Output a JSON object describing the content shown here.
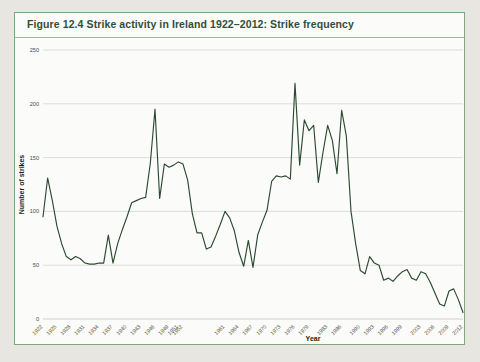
{
  "figure": {
    "title": "Figure 12.4  Strike activity in Ireland 1922–2012: Strike frequency",
    "frame_color": "#7ea87a",
    "background_color": "#fbfbf9"
  },
  "chart_data": {
    "type": "line",
    "title": "Figure 12.4  Strike activity in Ireland 1922–2012: Strike frequency",
    "xlabel": "Year",
    "ylabel": "Number of strikes",
    "line_color": "#2c4a31",
    "grid": true,
    "legend": "none",
    "ylim": [
      0,
      250
    ],
    "ytick_labels": [
      "0",
      "50",
      "100",
      "150",
      "200",
      "250"
    ],
    "yticks": [
      0,
      50,
      100,
      150,
      200,
      250
    ],
    "xlim": [
      1922,
      2012
    ],
    "xtick_labels": [
      "1922",
      "1925",
      "1928",
      "1931",
      "1934",
      "1937",
      "1940",
      "1943",
      "1946",
      "1949",
      "1951",
      "1952",
      "1961",
      "1964",
      "1967",
      "1970",
      "1973",
      "1976",
      "1979",
      "1983",
      "1986",
      "1990",
      "1993",
      "1996",
      "1999",
      "2003",
      "2006",
      "2009",
      "2012"
    ],
    "xticks": [
      1922,
      1925,
      1928,
      1931,
      1934,
      1937,
      1940,
      1943,
      1946,
      1949,
      1951,
      1952,
      1961,
      1964,
      1967,
      1970,
      1973,
      1976,
      1979,
      1983,
      1986,
      1990,
      1993,
      1996,
      1999,
      2003,
      2006,
      2009,
      2012
    ],
    "x": [
      1922,
      1923,
      1924,
      1925,
      1926,
      1927,
      1928,
      1929,
      1930,
      1931,
      1932,
      1933,
      1934,
      1935,
      1936,
      1937,
      1938,
      1939,
      1940,
      1941,
      1942,
      1943,
      1944,
      1945,
      1946,
      1947,
      1948,
      1949,
      1950,
      1951,
      1952,
      1953,
      1954,
      1955,
      1956,
      1957,
      1958,
      1959,
      1960,
      1961,
      1962,
      1963,
      1964,
      1965,
      1966,
      1967,
      1968,
      1969,
      1970,
      1971,
      1972,
      1973,
      1974,
      1975,
      1976,
      1977,
      1978,
      1979,
      1980,
      1981,
      1982,
      1983,
      1984,
      1985,
      1986,
      1987,
      1988,
      1989,
      1990,
      1991,
      1992,
      1993,
      1994,
      1995,
      1996,
      1997,
      1998,
      1999,
      2000,
      2001,
      2002,
      2003,
      2004,
      2005,
      2006,
      2007,
      2008,
      2009,
      2010,
      2011,
      2012
    ],
    "values": [
      95,
      131,
      110,
      86,
      70,
      58,
      55,
      58,
      56,
      52,
      51,
      51,
      52,
      52,
      78,
      52,
      70,
      83,
      95,
      108,
      110,
      112,
      113,
      145,
      195,
      112,
      144,
      141,
      143,
      146,
      144,
      129,
      98,
      80,
      80,
      65,
      67,
      77,
      88,
      100,
      94,
      82,
      62,
      49,
      73,
      48,
      78,
      90,
      101,
      128,
      133,
      132,
      133,
      130,
      219,
      143,
      185,
      175,
      180,
      127,
      155,
      180,
      166,
      135,
      194,
      170,
      100,
      70,
      45,
      42,
      58,
      52,
      50,
      36,
      38,
      35,
      40,
      44,
      46,
      38,
      36,
      44,
      42,
      34,
      24,
      14,
      12,
      26,
      28,
      18,
      6
    ]
  },
  "axis_titles": {
    "x": "Year",
    "y": "Number of strikes"
  }
}
